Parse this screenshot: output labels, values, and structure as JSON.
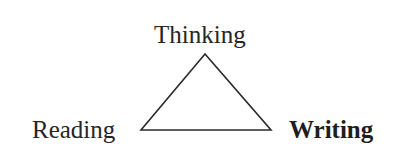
{
  "diagram": {
    "type": "triangle",
    "nodes": [
      {
        "id": "thinking",
        "label": "Thinking",
        "position": "top",
        "bold": false
      },
      {
        "id": "reading",
        "label": "Reading",
        "position": "bottom-left",
        "bold": false
      },
      {
        "id": "writing",
        "label": "Writing",
        "position": "bottom-right",
        "bold": true
      }
    ],
    "edges": [
      {
        "from": "thinking",
        "to": "reading"
      },
      {
        "from": "reading",
        "to": "writing"
      },
      {
        "from": "writing",
        "to": "thinking"
      }
    ],
    "colors": {
      "stroke": "#2a2a2a",
      "text": "#262626",
      "background": "#ffffff"
    }
  }
}
